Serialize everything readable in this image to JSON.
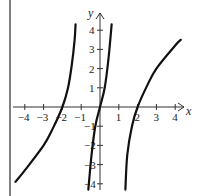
{
  "chart_data": {
    "type": "line",
    "title": "",
    "xlabel": "x",
    "ylabel": "y",
    "xlim": [
      -4.5,
      4.5
    ],
    "ylim": [
      -4.3,
      4.5
    ],
    "grid": false,
    "x_ticks": [
      "-4",
      "-3",
      "-2",
      "-1",
      "1",
      "2",
      "3",
      "4"
    ],
    "y_ticks": [
      "4",
      "3",
      "2",
      "1",
      "-1",
      "-2",
      "-3",
      "-4"
    ],
    "series": [
      {
        "name": "left branch",
        "points": [
          [
            -4.5,
            -3.9
          ],
          [
            -4,
            -3.3
          ],
          [
            -3,
            -2.0
          ],
          [
            -2.5,
            -1.1
          ],
          [
            -2,
            0
          ],
          [
            -1.7,
            1.0
          ],
          [
            -1.5,
            2.2
          ],
          [
            -1.35,
            3.5
          ],
          [
            -1.3,
            4.3
          ]
        ]
      },
      {
        "name": "center branch",
        "points": [
          [
            -0.62,
            -4.3
          ],
          [
            -0.45,
            -2.5
          ],
          [
            -0.25,
            -1.0
          ],
          [
            0,
            0
          ],
          [
            0.25,
            1.0
          ],
          [
            0.45,
            2.5
          ],
          [
            0.62,
            4.3
          ]
        ]
      },
      {
        "name": "right branch",
        "points": [
          [
            1.35,
            -4.3
          ],
          [
            1.45,
            -2.5
          ],
          [
            1.7,
            -1.0
          ],
          [
            2,
            0
          ],
          [
            2.5,
            1.1
          ],
          [
            3,
            2.0
          ],
          [
            4,
            3.2
          ],
          [
            4.3,
            3.5
          ]
        ]
      }
    ]
  },
  "axes": {
    "x_label": "x",
    "y_label": "y"
  }
}
